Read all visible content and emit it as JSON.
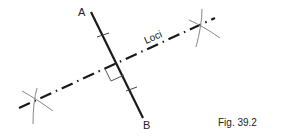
{
  "figure": {
    "caption": "Fig. 39.2",
    "point_a_label": "A",
    "point_b_label": "B",
    "loci_label": "Loci"
  },
  "colors": {
    "line": "#1a1a1a",
    "construction": "#888888",
    "background": "#ffffff"
  }
}
